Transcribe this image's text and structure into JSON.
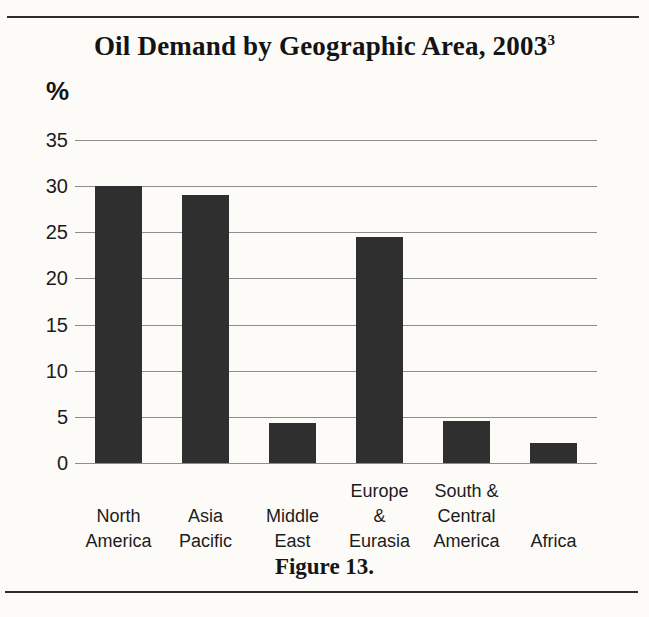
{
  "chart_data": {
    "type": "bar",
    "title": "Oil Demand by Geographic Area, 2003",
    "title_footnote_mark": "3",
    "ylabel": "%",
    "caption": "Figure 13.",
    "categories": [
      "North America",
      "Asia Pacific",
      "Middle East",
      "Europe & Eurasia",
      "South & Central America",
      "Africa"
    ],
    "category_label_lines": [
      [
        "North",
        "America"
      ],
      [
        "Asia",
        "Pacific"
      ],
      [
        "Middle",
        "East"
      ],
      [
        "Europe",
        "&",
        "Eurasia"
      ],
      [
        "South &",
        "Central",
        "America"
      ],
      [
        "Africa"
      ]
    ],
    "values": [
      30,
      29,
      4.3,
      24.5,
      4.6,
      2.2
    ],
    "yticks": [
      0,
      5,
      10,
      15,
      20,
      25,
      30,
      35
    ],
    "ylim": [
      0,
      35
    ],
    "grid": true,
    "legend": "none",
    "bar_color": "#2f2f2f",
    "gridline_color": "#8d8d8d",
    "text_color": "#1c1c1c",
    "background_color": "#fcfbf8",
    "rule_color": "#2d2d2d"
  }
}
